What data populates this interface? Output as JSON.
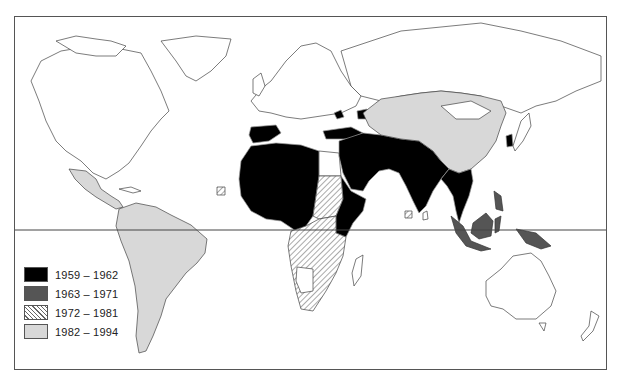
{
  "map": {
    "type": "choropleth world map",
    "has_equator_line": true,
    "colors": {
      "1959-1962": "#000000",
      "1963-1971": "#555555",
      "1972-1981": "hatched",
      "1982-1994": "#d8d8d8",
      "none": "#ffffff"
    }
  },
  "legend": {
    "items": [
      {
        "label": "1959 – 1962",
        "style": "solid-black"
      },
      {
        "label": "1963 – 1971",
        "style": "dark-grey"
      },
      {
        "label": "1972 – 1981",
        "style": "hatched"
      },
      {
        "label": "1982 – 1994",
        "style": "light-grey"
      }
    ]
  },
  "regions": {
    "1959-1962": [
      "Spain",
      "North Africa",
      "West Africa",
      "Central Africa",
      "Turkey",
      "Middle East",
      "Arabian Peninsula",
      "East Africa",
      "Horn of Africa",
      "Iran",
      "Afghanistan",
      "Pakistan",
      "India",
      "Southeast Asia mainland",
      "South Korea",
      "Caucasus"
    ],
    "1963-1971": [
      "Indonesia",
      "Malaysia",
      "Borneo",
      "Philippines",
      "New Guinea"
    ],
    "1972-1981": [
      "Sudan",
      "Southern Africa",
      "Angola",
      "Zambia",
      "Mozambique",
      "Tanzania"
    ],
    "1982-1994": [
      "Mexico",
      "Central America",
      "South America",
      "China",
      "Central Asia",
      "Mongolia"
    ]
  }
}
